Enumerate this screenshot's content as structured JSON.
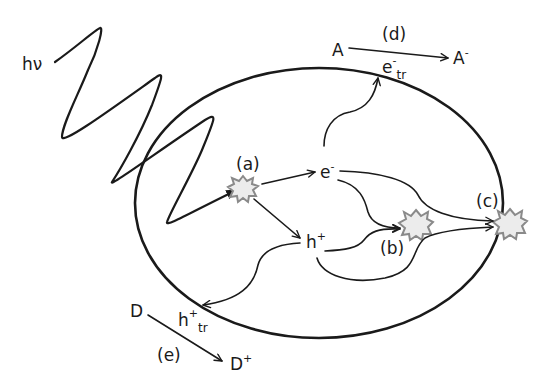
{
  "diagram": {
    "type": "photocatalysis-charge-carrier-schematic",
    "labels": {
      "photon": "hν",
      "step_a": "(a)",
      "step_b": "(b)",
      "step_c": "(c)",
      "step_d": "(d)",
      "step_e": "(e)",
      "electron": "e",
      "electron_sup": "-",
      "hole": "h",
      "hole_sup": "+",
      "trapped_electron": "e",
      "trapped_electron_sup": "-",
      "trapped_electron_sub": "tr",
      "trapped_hole": "h",
      "trapped_hole_sup": "+",
      "trapped_hole_sub": "tr",
      "acceptor": "A",
      "acceptor_reduced": "A",
      "acceptor_reduced_sup": "-",
      "donor": "D",
      "donor_oxidized": "D",
      "donor_oxidized_sup": "+"
    },
    "colors": {
      "line": "#1a1a1a",
      "burst_fill": "#ececec",
      "burst_edge": "#8a8a8a",
      "background": "#ffffff"
    },
    "processes": [
      {
        "id": "a",
        "description": "photoexcitation generating e- and h+"
      },
      {
        "id": "b",
        "description": "bulk recombination"
      },
      {
        "id": "c",
        "description": "surface recombination"
      },
      {
        "id": "d",
        "description": "acceptor reduction A to A- by trapped electron"
      },
      {
        "id": "e",
        "description": "donor oxidation D to D+ by trapped hole"
      }
    ]
  }
}
